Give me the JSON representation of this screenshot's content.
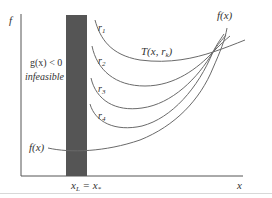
{
  "figure": {
    "axis_labels": {
      "y": "f",
      "x": "x"
    },
    "constraint_label": "g(x) < 0",
    "region_label": "infeasible",
    "curve_labels": {
      "objective_top": "f(x)",
      "objective_left": "f(x)",
      "penalty_family": "T(x, r",
      "penalty_family_sub": "k",
      "penalty_family_close": ")"
    },
    "r_labels": [
      {
        "base": "r",
        "sub": "1"
      },
      {
        "base": "r",
        "sub": "2"
      },
      {
        "base": "r",
        "sub": "3"
      },
      {
        "base": "r",
        "sub": "4"
      }
    ],
    "bottom_label": {
      "left": "x",
      "left_sub": "L",
      "eq": " = x",
      "right_sub": "*"
    },
    "colors": {
      "bar": "#555555",
      "curve": "#6a6a6a",
      "axis": "#555555"
    }
  }
}
